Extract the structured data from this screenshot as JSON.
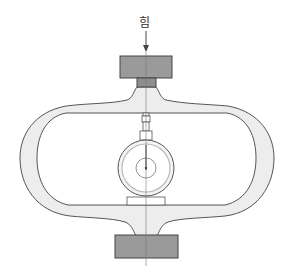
{
  "diagram": {
    "type": "proving-ring-schematic",
    "labels": {
      "force": "힘"
    },
    "colors": {
      "ring_fill": "#ededed",
      "ring_stroke": "#555555",
      "block_fill": "#9a9a9a",
      "block_stroke": "#444444",
      "centerline": "#777777",
      "gauge_stroke": "#555555",
      "gauge_inner_ring": "#bbbbbb",
      "background": "#ffffff"
    },
    "components": [
      {
        "name": "force-arrow",
        "label": "힘"
      },
      {
        "name": "top-load-block"
      },
      {
        "name": "proving-ring"
      },
      {
        "name": "dial-gauge"
      },
      {
        "name": "bottom-load-block"
      },
      {
        "name": "centerline"
      }
    ]
  }
}
